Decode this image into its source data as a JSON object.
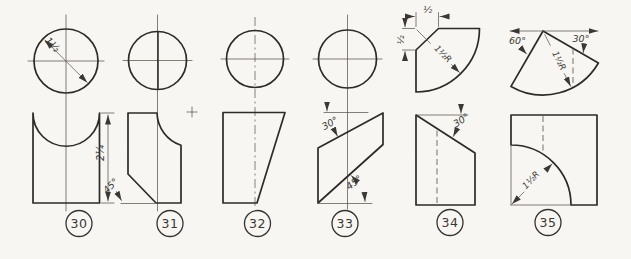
{
  "sheet": {
    "description": "Orthographic projection exercise drawings, figures 30-35, each with circular top view and sectioned front view",
    "figures": {
      "f30": {
        "label": "30",
        "dims": {
          "diameter": "1½",
          "height": "2¼"
        }
      },
      "f31": {
        "label": "31",
        "dims": {
          "chamfer_angle": "45°"
        }
      },
      "f32": {
        "label": "32",
        "dims": {}
      },
      "f33": {
        "label": "33",
        "dims": {
          "top_angle": "30°",
          "bottom_angle": "45°"
        }
      },
      "f34": {
        "label": "34",
        "dims": {
          "top_offset": "½",
          "side_offset": "½",
          "radius": "1½R",
          "slope_angle": "30°"
        }
      },
      "f35": {
        "label": "35",
        "dims": {
          "left_angle": "60°",
          "right_angle": "30°",
          "radius_top": "1½R",
          "radius_front": "1½R"
        }
      }
    }
  }
}
